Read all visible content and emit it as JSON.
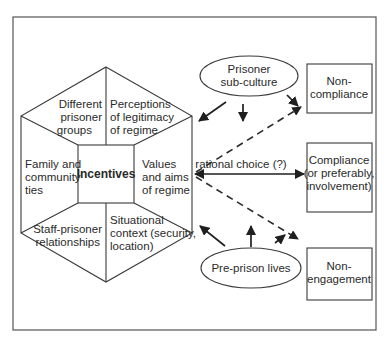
{
  "diagram": {
    "hexagon": {
      "center_label": "Incentives",
      "segments": {
        "top_left": [
          "Different",
          "prisoner",
          "groups"
        ],
        "top_right": [
          "Perceptions",
          "of legitimacy",
          "of regime"
        ],
        "left": [
          "Family and",
          "community",
          "ties"
        ],
        "right": [
          "Values",
          "and aims",
          "of regime"
        ],
        "bottom_left": [
          "Staff-prisoner",
          "relationships"
        ],
        "bottom_right": [
          "Situational",
          "context (security,",
          "location)"
        ]
      }
    },
    "influences": {
      "top": [
        "Prisoner",
        "sub-culture"
      ],
      "bottom": [
        "Pre-prison lives"
      ]
    },
    "edge_label": "rational choice (?)",
    "outcomes": {
      "non_compliance": [
        "Non-",
        "compliance"
      ],
      "compliance": [
        "Compliance",
        "(or preferably,",
        "involvement)"
      ],
      "non_engagement": [
        "Non-",
        "engagement"
      ]
    }
  }
}
